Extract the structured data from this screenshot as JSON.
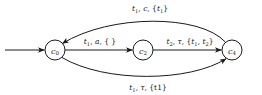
{
  "diagram": {
    "type": "state-transition-automaton",
    "background_color": "#ffffff",
    "stroke_color": "#1a1a1a",
    "states": [
      {
        "id": "c0",
        "label": "c",
        "subscript": "0",
        "cx": 55,
        "cy": 50,
        "r": 10,
        "initial": true
      },
      {
        "id": "c2",
        "label": "c",
        "subscript": "2",
        "cx": 143,
        "cy": 50,
        "r": 10,
        "initial": false
      },
      {
        "id": "c4",
        "label": "c",
        "subscript": "4",
        "cx": 232,
        "cy": 50,
        "r": 10,
        "initial": false
      }
    ],
    "start_arrow": {
      "name": "initial-state-arrow",
      "from_x": 5,
      "to_x": 45,
      "y": 50
    },
    "transitions": [
      {
        "id": "t-c4-c0",
        "from": "c4",
        "to": "c0",
        "shape": "arc-top",
        "label_parts": {
          "clock": "t",
          "clock_sub": "1",
          "action": "c",
          "resets": "{t",
          "resets_sub": "1",
          "resets_end": "}"
        },
        "label_text": "t1, c, {t1}",
        "label_x": 150,
        "label_y": 11
      },
      {
        "id": "t-c0-c2",
        "from": "c0",
        "to": "c2",
        "shape": "straight",
        "label_parts": {
          "clock": "t",
          "clock_sub": "1",
          "action": "a",
          "resets": "{ }",
          "resets_sub": "",
          "resets_end": ""
        },
        "label_text": "t1, a, { }",
        "label_x": 100,
        "label_y": 44
      },
      {
        "id": "t-c2-c4",
        "from": "c2",
        "to": "c4",
        "shape": "straight",
        "label_parts": {
          "clock": "t",
          "clock_sub": "2",
          "action": "τ",
          "resets": "{t",
          "resets_sub": "1",
          "resets_end": ", t2}"
        },
        "label_text": "t2, τ, {t1, t2}",
        "label_x": 190,
        "label_y": 44
      },
      {
        "id": "t-c0-c4",
        "from": "c0",
        "to": "c4",
        "shape": "arc-bottom",
        "label_parts": {
          "clock": "t",
          "clock_sub": "1",
          "action": "τ",
          "resets": "{t1}",
          "resets_sub": "",
          "resets_end": ""
        },
        "label_text": "t1, τ, {t1}",
        "label_x": 148,
        "label_y": 90
      }
    ]
  }
}
